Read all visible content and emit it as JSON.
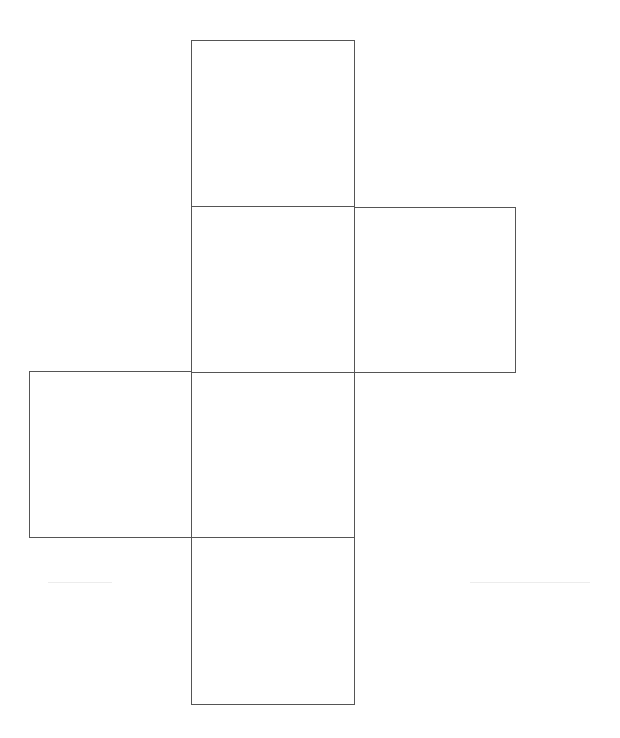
{
  "diagram": {
    "type": "cube-net",
    "stroke_color": "#555555",
    "background": "#ffffff",
    "faces": [
      {
        "id": "top",
        "x": 191,
        "y": 40,
        "w": 163,
        "h": 166
      },
      {
        "id": "upper-mid",
        "x": 191,
        "y": 206,
        "w": 163,
        "h": 166
      },
      {
        "id": "right",
        "x": 354,
        "y": 207,
        "w": 161,
        "h": 165
      },
      {
        "id": "left",
        "x": 29,
        "y": 371,
        "w": 162,
        "h": 166
      },
      {
        "id": "lower-mid",
        "x": 191,
        "y": 372,
        "w": 163,
        "h": 165
      },
      {
        "id": "bottom",
        "x": 191,
        "y": 537,
        "w": 163,
        "h": 167
      }
    ],
    "faint_lines": [
      {
        "id": "left-faint",
        "x": 48,
        "y": 582,
        "w": 64
      },
      {
        "id": "right-faint",
        "x": 470,
        "y": 582,
        "w": 120
      }
    ]
  }
}
